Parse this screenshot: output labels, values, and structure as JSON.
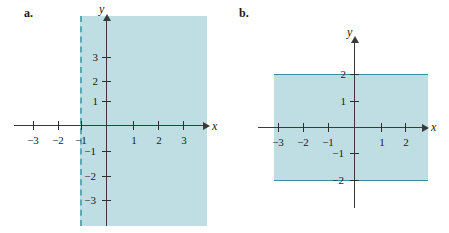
{
  "figure": {
    "background_color": "#ffffff",
    "shade_color": "#bfdee3",
    "axis_color": "#3a3a3a",
    "boundary_color": "#5aa8b4"
  },
  "panels": [
    {
      "label": "a.",
      "axis_x_name": "x",
      "axis_y_name": "y",
      "x_ticks": [
        {
          "value": -3,
          "label": "−3",
          "px": 33
        },
        {
          "value": -2,
          "label": "−2",
          "px": 58
        },
        {
          "value": -1,
          "label": "−1",
          "px": 81
        },
        {
          "value": 1,
          "label": "1",
          "px": 133
        },
        {
          "value": 2,
          "label": "2",
          "px": 158
        },
        {
          "value": 3,
          "label": "3",
          "px": 183
        }
      ],
      "y_ticks": [
        {
          "value": 3,
          "label": "3",
          "px": 57
        },
        {
          "value": 2,
          "label": "2",
          "px": 81
        },
        {
          "value": 1,
          "label": "1",
          "px": 101
        },
        {
          "value": -1,
          "label": "−1",
          "px": 151
        },
        {
          "value": -2,
          "label": "−2",
          "px": 176
        },
        {
          "value": -3,
          "label": "−3",
          "px": 200
        }
      ],
      "region": {
        "description": "shaded half-plane to the right of x = -1",
        "boundary_type": "dashed",
        "boundary_value": -1,
        "inequality": "x > -1"
      }
    },
    {
      "label": "b.",
      "axis_x_name": "x",
      "axis_y_name": "y",
      "x_ticks": [
        {
          "value": -3,
          "label": "−3",
          "px": 48
        },
        {
          "value": -2,
          "label": "−2",
          "px": 73
        },
        {
          "value": -1,
          "label": "−1",
          "px": 98
        },
        {
          "value": 1,
          "label": "1",
          "px": 151
        },
        {
          "value": 2,
          "label": "2",
          "px": 175
        }
      ],
      "y_ticks": [
        {
          "value": 2,
          "label": "2",
          "px": 74
        },
        {
          "value": 1,
          "label": "1",
          "px": 101
        },
        {
          "value": -1,
          "label": "−1",
          "px": 153
        },
        {
          "value": -2,
          "label": "−2",
          "px": 180
        }
      ],
      "region": {
        "description": "shaded horizontal band between y = -2 and y = 2",
        "boundary_type": "solid",
        "boundary_values": [
          -2,
          2
        ],
        "inequality": "-2 ≤ y ≤ 2"
      }
    }
  ]
}
